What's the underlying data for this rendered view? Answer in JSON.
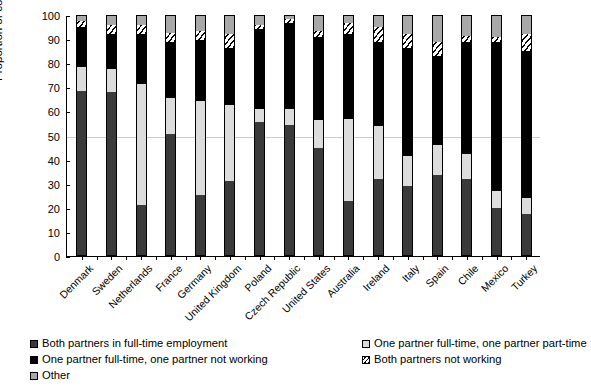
{
  "chart_data": {
    "type": "bar",
    "subtype": "stacked-bar-100-percent",
    "title": "",
    "xlabel": "",
    "ylabel": "Proportion of couples  (%)",
    "ylim": [
      0,
      100
    ],
    "yticks": [
      0,
      10,
      20,
      30,
      40,
      50,
      60,
      70,
      80,
      90,
      100
    ],
    "ytick_labels": [
      "0",
      "10",
      "20",
      "30",
      "40",
      "50",
      "60",
      "70",
      "80",
      "90",
      "100"
    ],
    "grid": "horizontal gridline at 50 only",
    "legend_position": "below-plot, two columns",
    "categories": [
      "Denmark",
      "Sweden",
      "Netherlands",
      "France",
      "Germany",
      "United Kingdom",
      "Poland",
      "Czech Republic",
      "United States",
      "Australia",
      "Ireland",
      "Italy",
      "Spain",
      "Chile",
      "Mexico",
      "Turkey"
    ],
    "series": [
      {
        "name": "Both partners in full-time employment",
        "color": "#3a3a3a",
        "values": [
          68.5,
          68.0,
          21.0,
          50.5,
          25.5,
          31.0,
          55.5,
          54.5,
          45.0,
          23.0,
          32.0,
          29.0,
          33.5,
          32.0,
          20.0,
          17.5
        ]
      },
      {
        "name": "One partner full-time, one partner part-time",
        "color": "#dcdcdc",
        "values": [
          10.0,
          9.5,
          50.5,
          15.0,
          39.0,
          31.5,
          5.5,
          6.5,
          11.5,
          34.0,
          22.0,
          12.5,
          12.5,
          10.5,
          7.0,
          6.5
        ]
      },
      {
        "name": "One partner full-time, one partner not working",
        "color": "#000000",
        "values": [
          16.5,
          14.5,
          20.5,
          23.5,
          25.0,
          24.0,
          33.0,
          35.5,
          34.5,
          35.0,
          35.0,
          45.0,
          37.0,
          46.5,
          62.0,
          61.0
        ]
      },
      {
        "name": "Both partners not working",
        "color": "hatched",
        "values": [
          2.5,
          4.0,
          4.0,
          3.5,
          4.0,
          5.5,
          2.0,
          2.0,
          2.5,
          4.5,
          6.0,
          5.5,
          6.0,
          2.5,
          2.0,
          7.0
        ]
      },
      {
        "name": "Other",
        "color": "#a8a8a8",
        "values": [
          2.5,
          4.0,
          4.0,
          7.5,
          6.5,
          8.0,
          4.0,
          1.5,
          6.5,
          3.5,
          5.0,
          8.0,
          11.0,
          8.5,
          9.0,
          8.0
        ]
      }
    ]
  },
  "legend": {
    "left_column": [
      {
        "label": "Both partners in full-time employment",
        "swatch": "k0"
      },
      {
        "label": "One partner full-time, one partner not working",
        "swatch": "k1"
      },
      {
        "label": "Other",
        "swatch": "k2"
      }
    ],
    "right_column": [
      {
        "label": "One partner full-time, one partner part-time",
        "swatch": "k3"
      },
      {
        "label": "Both partners not working",
        "swatch": "k4"
      }
    ]
  }
}
